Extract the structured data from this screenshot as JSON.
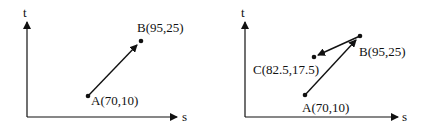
{
  "diagrams": [
    {
      "name": "left",
      "x_axis_label": "s",
      "y_axis_label": "t",
      "points": [
        {
          "id": "A",
          "label": "A(70,10)",
          "s": 70,
          "t": 10
        },
        {
          "id": "B",
          "label": "B(95,25)",
          "s": 95,
          "t": 25
        }
      ],
      "vectors": [
        {
          "from": "A",
          "to": "B"
        }
      ]
    },
    {
      "name": "right",
      "x_axis_label": "s",
      "y_axis_label": "t",
      "points": [
        {
          "id": "A",
          "label": "A(70,10)",
          "s": 70,
          "t": 10
        },
        {
          "id": "B",
          "label": "B(95,25)",
          "s": 95,
          "t": 25
        },
        {
          "id": "C",
          "label": "C(82.5,17.5)",
          "s": 82.5,
          "t": 17.5
        }
      ],
      "vectors": [
        {
          "from": "A",
          "to": "B"
        },
        {
          "from": "B",
          "to": "C"
        }
      ]
    }
  ],
  "colors": {
    "ink": "#111111",
    "background": "#ffffff"
  }
}
